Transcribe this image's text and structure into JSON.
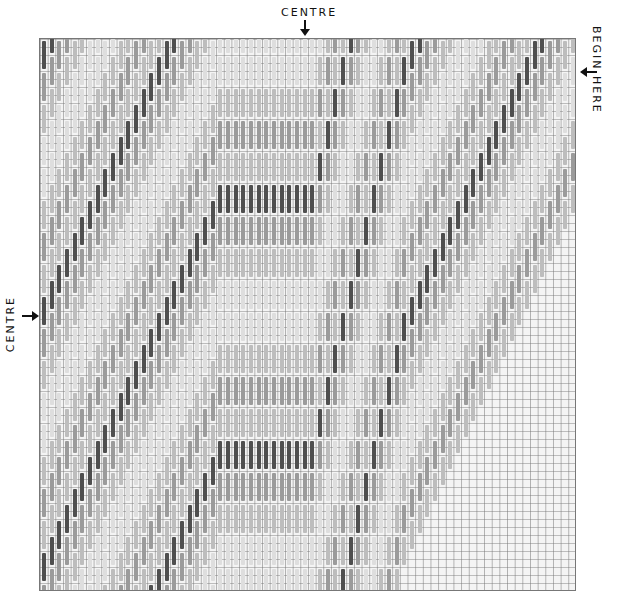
{
  "labels": {
    "top": "CENTRE",
    "left": "CENTRE",
    "right": "BEGIN HERE"
  },
  "chart": {
    "columns": 70,
    "rows": 69,
    "stitch_span": 4,
    "palette": {
      "dark": "#4f4f4f",
      "mid": "#9b9b9b",
      "light": "#bdbdbd",
      "pale": "#dedede",
      "grid": "#787878",
      "canvas": "#f4f4f4"
    },
    "band_cycle": [
      "dark",
      "mid",
      "light",
      "pale",
      "pale",
      "light",
      "mid",
      "light"
    ]
  }
}
